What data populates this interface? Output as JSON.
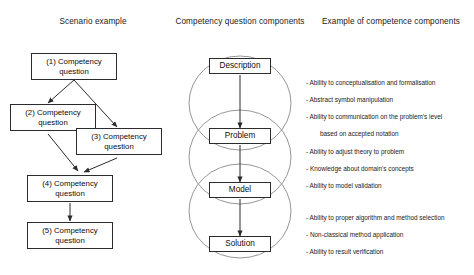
{
  "columns": {
    "scenario_title": "Scenario example",
    "components_title": "Competency question components",
    "examples_title": "Example of competence components"
  },
  "scenario_nodes": [
    {
      "id": "cq1",
      "label": "(1) Competency question"
    },
    {
      "id": "cq2",
      "label": "(2) Competency question"
    },
    {
      "id": "cq3",
      "label": "(3) Competency question"
    },
    {
      "id": "cq4",
      "label": "(4) Competency question"
    },
    {
      "id": "cq5",
      "label": "(5) Competency question"
    }
  ],
  "component_nodes": [
    {
      "id": "description",
      "label": "Description"
    },
    {
      "id": "problem",
      "label": "Problem"
    },
    {
      "id": "model",
      "label": "Model"
    },
    {
      "id": "solution",
      "label": "Solution"
    }
  ],
  "competence_groups": [
    {
      "id": "group-description-problem",
      "lines": [
        "- Ability to conceptualisation and formalisation",
        "- Abstract symbol manipulation",
        "- Ability to communication on the problem's level"
      ],
      "continuation": "based on accepted notation"
    },
    {
      "id": "group-problem-model",
      "lines": [
        "- Ability to adjust theory to problem",
        "- Knowledge about domain's concepts",
        "- Ability to model validation"
      ],
      "continuation": ""
    },
    {
      "id": "group-model-solution",
      "lines": [
        "- Ability to proper algorithm and method selection",
        "- Non-classical method application",
        "- Ability to result verification"
      ],
      "continuation": ""
    }
  ],
  "colors": {
    "background": "#ffffff",
    "stroke": "#2b2b2b",
    "ellipse_stroke": "#8a8a8a",
    "text": "#111111"
  }
}
